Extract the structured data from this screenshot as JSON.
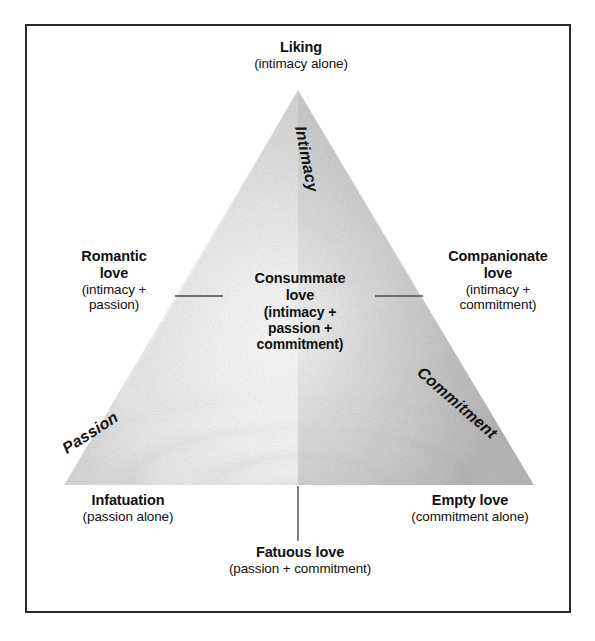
{
  "figure": {
    "frame_color": "#2b2b2b",
    "background_color": "#ffffff"
  },
  "vertices": [
    {
      "id": "liking",
      "name": "Liking",
      "detail": "(intimacy alone)",
      "position": "top"
    },
    {
      "id": "infatuation",
      "name": "Infatuation",
      "detail": "(passion alone)",
      "position": "bottom-left"
    },
    {
      "id": "empty-love",
      "name": "Empty love",
      "detail": "(commitment alone)",
      "position": "bottom-right"
    }
  ],
  "sides": [
    {
      "id": "romantic-love",
      "name_line1": "Romantic",
      "name_line2": "love",
      "detail_line1": "(intimacy +",
      "detail_line2": "passion)",
      "position": "left"
    },
    {
      "id": "companionate-love",
      "name_line1": "Companionate",
      "name_line2": "love",
      "detail_line1": "(intimacy +",
      "detail_line2": "commitment)",
      "position": "right"
    },
    {
      "id": "fatuous-love",
      "name": "Fatuous love",
      "detail": "(passion + commitment)",
      "position": "bottom"
    }
  ],
  "center": {
    "id": "consummate-love",
    "name_line1": "Consummate",
    "name_line2": "love",
    "detail_line1": "(intimacy +",
    "detail_line2": "passion +",
    "detail_line3": "commitment)"
  },
  "axes": [
    {
      "id": "intimacy",
      "label": "Intimacy",
      "edge": "upper-left"
    },
    {
      "id": "passion",
      "label": "Passion",
      "edge": "lower-left"
    },
    {
      "id": "commitment",
      "label": "Commitment",
      "edge": "lower-right"
    }
  ]
}
